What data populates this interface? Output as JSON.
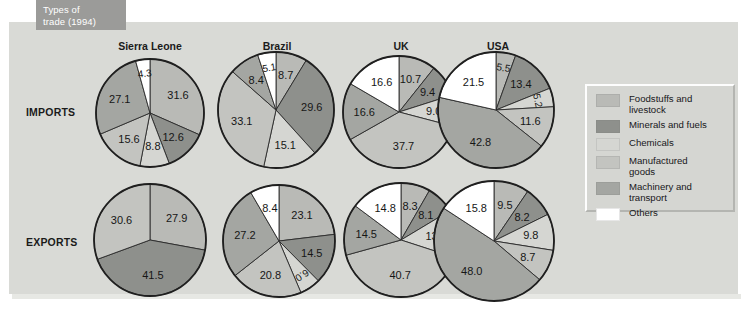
{
  "title": {
    "line1": "Types of",
    "line2": "trade (1994)"
  },
  "row_labels": [
    "IMPORTS",
    "EXPORTS"
  ],
  "columns": [
    "Sierra Leone",
    "Brazil",
    "UK",
    "USA"
  ],
  "legend": {
    "items": [
      {
        "label": "Foodstuffs and\nlivestock",
        "color": "#b9bab6",
        "key": "foodstuffs"
      },
      {
        "label": "Minerals and fuels",
        "color": "#8e908c",
        "key": "minerals"
      },
      {
        "label": "Chemicals",
        "color": "#d5d6d2",
        "key": "chemicals"
      },
      {
        "label": "Manufactured\ngoods",
        "color": "#c3c4c0",
        "key": "manufactured"
      },
      {
        "label": "Machinery and\ntransport",
        "color": "#a4a6a2",
        "key": "machinery"
      },
      {
        "label": "Others",
        "color": "#ffffff",
        "key": "others"
      }
    ]
  },
  "chart_data": {
    "type": "pie",
    "title": "Types of trade (1994)",
    "unit": "percent",
    "categories": [
      "Foodstuffs and livestock",
      "Minerals and fuels",
      "Chemicals",
      "Manufactured goods",
      "Machinery and transport",
      "Others"
    ],
    "category_colors": [
      "#b9bab6",
      "#8e908c",
      "#d5d6d2",
      "#c3c4c0",
      "#a4a6a2",
      "#ffffff"
    ],
    "rows": [
      "IMPORTS",
      "EXPORTS"
    ],
    "countries": [
      "Sierra Leone",
      "Brazil",
      "UK",
      "USA"
    ],
    "charts": [
      {
        "row": "IMPORTS",
        "country": "Sierra Leone",
        "slices": [
          {
            "category": "Foodstuffs and livestock",
            "value": 31.6
          },
          {
            "category": "Minerals and fuels",
            "value": 12.6
          },
          {
            "category": "Chemicals",
            "value": 8.8
          },
          {
            "category": "Manufactured goods",
            "value": 15.6
          },
          {
            "category": "Machinery and transport",
            "value": 27.1
          },
          {
            "category": "Others",
            "value": 4.3
          }
        ]
      },
      {
        "row": "IMPORTS",
        "country": "Brazil",
        "slices": [
          {
            "category": "Foodstuffs and livestock",
            "value": 8.7
          },
          {
            "category": "Minerals and fuels",
            "value": 29.6
          },
          {
            "category": "Chemicals",
            "value": 15.1
          },
          {
            "category": "Manufactured goods",
            "value": 33.1
          },
          {
            "category": "Machinery and transport",
            "value": 8.4
          },
          {
            "category": "Others",
            "value": 5.1
          }
        ]
      },
      {
        "row": "IMPORTS",
        "country": "UK",
        "slices": [
          {
            "category": "Foodstuffs and livestock",
            "value": 10.7
          },
          {
            "category": "Minerals and fuels",
            "value": 9.4
          },
          {
            "category": "Chemicals",
            "value": 9.0
          },
          {
            "category": "Manufactured goods",
            "value": 37.7
          },
          {
            "category": "Machinery and transport",
            "value": 16.6
          },
          {
            "category": "Others",
            "value": 16.6
          }
        ]
      },
      {
        "row": "IMPORTS",
        "country": "USA",
        "slices": [
          {
            "category": "Foodstuffs and livestock",
            "value": 5.5
          },
          {
            "category": "Minerals and fuels",
            "value": 13.4
          },
          {
            "category": "Chemicals",
            "value": 5.2
          },
          {
            "category": "Manufactured goods",
            "value": 11.6
          },
          {
            "category": "Machinery and transport",
            "value": 42.8
          },
          {
            "category": "Others",
            "value": 21.5
          }
        ]
      },
      {
        "row": "EXPORTS",
        "country": "Sierra Leone",
        "slices": [
          {
            "category": "Foodstuffs and livestock",
            "value": 27.9
          },
          {
            "category": "Minerals and fuels",
            "value": 41.5
          },
          {
            "category": "Manufactured goods",
            "value": 30.6
          }
        ]
      },
      {
        "row": "EXPORTS",
        "country": "Brazil",
        "slices": [
          {
            "category": "Foodstuffs and livestock",
            "value": 23.1
          },
          {
            "category": "Minerals and fuels",
            "value": 14.5
          },
          {
            "category": "Chemicals",
            "value": 6.0
          },
          {
            "category": "Manufactured goods",
            "value": 20.8
          },
          {
            "category": "Machinery and transport",
            "value": 27.2
          },
          {
            "category": "Others",
            "value": 8.4
          }
        ]
      },
      {
        "row": "EXPORTS",
        "country": "UK",
        "slices": [
          {
            "category": "Foodstuffs and livestock",
            "value": 8.3
          },
          {
            "category": "Minerals and fuels",
            "value": 8.1
          },
          {
            "category": "Chemicals",
            "value": 13.6
          },
          {
            "category": "Manufactured goods",
            "value": 40.7
          },
          {
            "category": "Machinery and transport",
            "value": 14.5
          },
          {
            "category": "Others",
            "value": 14.8
          }
        ]
      },
      {
        "row": "EXPORTS",
        "country": "USA",
        "slices": [
          {
            "category": "Foodstuffs and livestock",
            "value": 9.5
          },
          {
            "category": "Minerals and fuels",
            "value": 8.2
          },
          {
            "category": "Chemicals",
            "value": 9.8
          },
          {
            "category": "Manufactured goods",
            "value": 8.7
          },
          {
            "category": "Machinery and transport",
            "value": 48.0
          },
          {
            "category": "Others",
            "value": 15.8
          }
        ]
      }
    ]
  }
}
